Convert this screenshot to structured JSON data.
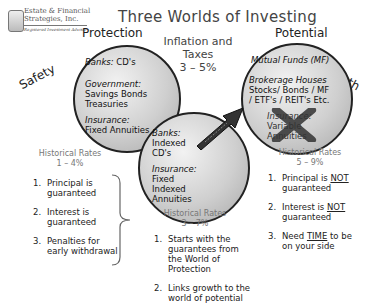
{
  "logo": {
    "line1": "Estate & Financial",
    "line2": "Strategies, Inc.",
    "line3": "Registered Investment Advisor"
  },
  "title": "Three Worlds  of Investing",
  "inflation": {
    "label": "Inflation and Taxes",
    "value": "3 – 5%"
  },
  "worlds": {
    "protection": {
      "header": "Protection",
      "side_label": "Safety",
      "circle": [
        {
          "label": "Banks:",
          "items": [
            "CD's"
          ]
        },
        {
          "label": "Government:",
          "items": [
            "Savings Bonds",
            "Treasuries"
          ]
        },
        {
          "label": "Insurance:",
          "items": [
            "Fixed Annuities"
          ]
        }
      ],
      "rates_label": "Historical Rates",
      "rates_value": "1 – 4%",
      "points": [
        {
          "num": "1.",
          "text": "Principal is guaranteed"
        },
        {
          "num": "2.",
          "text": "Interest is guaranteed"
        },
        {
          "num": "3.",
          "text": "Penalties for  early withdrawal"
        }
      ]
    },
    "middle": {
      "circle": [
        {
          "label": "Banks:",
          "items": [
            "Indexed",
            "CD's"
          ]
        },
        {
          "label": "Insurance:",
          "items": [
            "Fixed",
            "Indexed",
            "Annuities"
          ]
        }
      ],
      "rates_label": "Historical Rates",
      "rates_value": "3 – 7%",
      "points": [
        {
          "num": "1.",
          "text": "Starts with the guarantees from the World of Protection"
        },
        {
          "num": "2.",
          "text": "Links growth to the world of potential"
        }
      ]
    },
    "potential": {
      "header": "Potential",
      "side_label": "Growth",
      "circle": [
        {
          "label": "Mutual Funds (MF)",
          "items": []
        },
        {
          "label": "Brokerage Houses",
          "items": [
            "Stocks/ Bonds / MF",
            "/ ETF's / REIT's Etc."
          ]
        },
        {
          "label": "Insurance:",
          "items": [
            "Variable",
            "Annuities"
          ],
          "crossed_out": true
        }
      ],
      "rates_label": "Historical Rates",
      "rates_value": "5 – 9%",
      "points": [
        {
          "num": "1.",
          "pre": "Principal is ",
          "emph": "NOT",
          "post": " guaranteed"
        },
        {
          "num": "2.",
          "pre": "Interest is ",
          "emph": "NOT",
          "post": " guaranteed"
        },
        {
          "num": "3.",
          "pre": "Need ",
          "emph": "TIME",
          "post": " to be on your side"
        }
      ]
    }
  },
  "colors": {
    "circle_border": "#222222",
    "circle_fill": "#cfcfcf",
    "rates_text": "#777777",
    "arrow": "#333333"
  }
}
